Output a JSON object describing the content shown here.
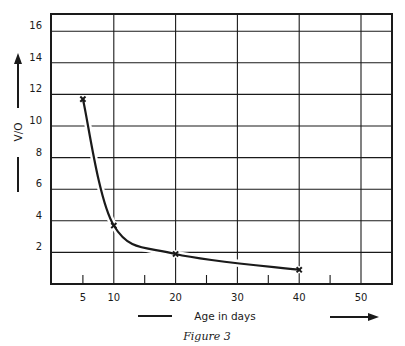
{
  "chart_data": {
    "type": "line",
    "title": "",
    "caption": "Figure 3",
    "xlabel": "Age in days",
    "ylabel": "V/O",
    "xlim": [
      0,
      55
    ],
    "ylim": [
      0,
      17
    ],
    "x_ticks": [
      5,
      10,
      20,
      30,
      40,
      50
    ],
    "x_minor_ticks": [
      5,
      15,
      25,
      35,
      45
    ],
    "x_gridlines": [
      10,
      20,
      30,
      40,
      50
    ],
    "y_ticks": [
      2,
      4,
      6,
      8,
      10,
      12,
      14,
      16
    ],
    "grid": true,
    "legend": null,
    "series": [
      {
        "name": "V/O",
        "marker": "x",
        "smooth": true,
        "x": [
          5,
          10,
          20,
          40
        ],
        "y": [
          11.7,
          3.7,
          1.9,
          0.9
        ]
      }
    ]
  },
  "labels": {
    "x_axis_title": "Age in days",
    "y_axis_title": "V/O",
    "caption": "Figure 3",
    "x_tick_labels": [
      "5",
      "10",
      "20",
      "30",
      "40",
      "50"
    ],
    "y_tick_labels": [
      "2",
      "4",
      "6",
      "8",
      "10",
      "12",
      "14",
      "16"
    ]
  },
  "style": {
    "ink": "#1a1a1a",
    "background": "#ffffff"
  }
}
